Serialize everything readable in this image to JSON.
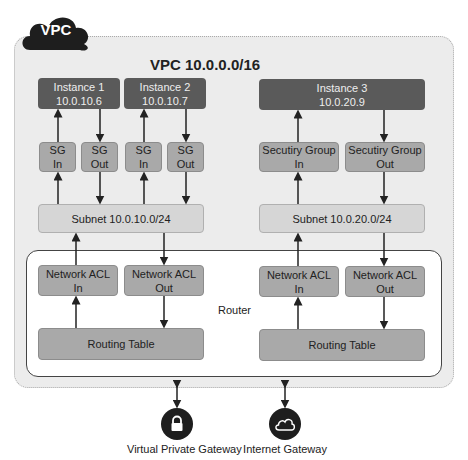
{
  "vpc": {
    "badge": "VPC",
    "title": "VPC 10.0.0.0/16"
  },
  "instances": [
    {
      "name": "Instance 1",
      "ip": "10.0.10.6"
    },
    {
      "name": "Instance 2",
      "ip": "10.0.10.7"
    },
    {
      "name": "Instance 3",
      "ip": "10.0.20.9"
    }
  ],
  "security_groups": {
    "left": [
      {
        "line1": "SG",
        "line2": "In"
      },
      {
        "line1": "SG",
        "line2": "Out"
      },
      {
        "line1": "SG",
        "line2": "In"
      },
      {
        "line1": "SG",
        "line2": "Out"
      }
    ],
    "right": [
      {
        "line1": "Secutiry Group",
        "line2": "In"
      },
      {
        "line1": "Secutiry Group",
        "line2": "Out"
      }
    ]
  },
  "subnets": [
    {
      "label": "Subnet 10.0.10.0/24"
    },
    {
      "label": "Subnet 10.0.20.0/24"
    }
  ],
  "router": {
    "label": "Router",
    "acls": [
      {
        "line1": "Network ACL",
        "line2": "In"
      },
      {
        "line1": "Network ACL",
        "line2": "Out"
      },
      {
        "line1": "Network ACL",
        "line2": "In"
      },
      {
        "line1": "Network ACL",
        "line2": "Out"
      }
    ],
    "routing_tables": [
      {
        "label": "Routing Table"
      },
      {
        "label": "Routing Table"
      }
    ]
  },
  "gateways": [
    {
      "label": "Virtual Private Gateway",
      "icon": "lock-icon"
    },
    {
      "label": "Internet Gateway",
      "icon": "cloud-icon"
    }
  ]
}
